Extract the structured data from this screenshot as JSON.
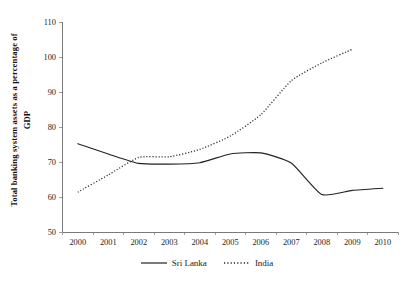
{
  "chart_data": {
    "type": "line",
    "title": "",
    "xlabel": "",
    "ylabel": "Total banking system assets as a percentage of GDP",
    "ylabel_line1": "Total banking system assets as a percentage of",
    "ylabel_line2": "GDP",
    "categories": [
      "2000",
      "2001",
      "2002",
      "2003",
      "2004",
      "2005",
      "2006",
      "2007",
      "2008",
      "2009",
      "2010"
    ],
    "x": [
      2000,
      2001,
      2002,
      2003,
      2004,
      2005,
      2006,
      2007,
      2008,
      2009,
      2010
    ],
    "xlim": [
      1999.5,
      2010.5
    ],
    "ylim": [
      50,
      110
    ],
    "yticks": [
      50,
      60,
      70,
      80,
      90,
      100,
      110
    ],
    "ytick_labels": [
      "50",
      "60",
      "70",
      "80",
      "90",
      "100",
      "110"
    ],
    "grid": false,
    "legend_position": "bottom-center",
    "series": [
      {
        "name": "Sri Lanka",
        "style": "solid",
        "color": "#222222",
        "x": [
          2000,
          2001,
          2002,
          2003,
          2004,
          2005,
          2006,
          2007,
          2008,
          2009,
          2010
        ],
        "values": [
          75.2,
          72.3,
          69.6,
          69.4,
          69.8,
          72.3,
          72.6,
          69.7,
          60.7,
          61.9,
          62.5
        ]
      },
      {
        "name": "India",
        "style": "dotted",
        "color": "#222222",
        "x": [
          2000,
          2001,
          2002,
          2003,
          2004,
          2005,
          2006,
          2007,
          2008,
          2009
        ],
        "values": [
          61.4,
          66.3,
          71.3,
          71.5,
          73.6,
          77.4,
          83.5,
          93.2,
          98.3,
          102.2
        ]
      }
    ]
  },
  "legend": {
    "items": [
      {
        "label": "Sri Lanka",
        "style": "solid"
      },
      {
        "label": "India",
        "style": "dotted"
      }
    ]
  }
}
